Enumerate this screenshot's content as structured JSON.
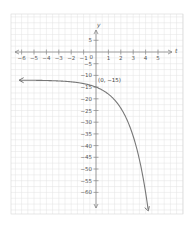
{
  "chart_data": {
    "type": "line",
    "title": "",
    "xlabel": "t",
    "ylabel": "y",
    "xlim": [
      -6.5,
      5.5
    ],
    "ylim": [
      -62,
      8
    ],
    "grid": true,
    "x_ticks": [
      -6,
      -5,
      -4,
      -3,
      -2,
      -1,
      1,
      2,
      3,
      4,
      5
    ],
    "y_ticks": [
      5,
      -5,
      -10,
      -15,
      -20,
      -25,
      -30,
      -35,
      -40,
      -45,
      -50,
      -55,
      -60
    ],
    "origin_label": "0",
    "series": [
      {
        "name": "curve",
        "description": "decreasing exponential, horizontal asymptote near y = -12, arrows on both ends",
        "x": [
          -6,
          -5,
          -4,
          -3,
          -2,
          -1,
          0,
          1,
          2,
          3,
          4,
          4.2
        ],
        "y": [
          -12.05,
          -12.1,
          -12.2,
          -12.4,
          -12.75,
          -13.5,
          -15,
          -18,
          -24,
          -36,
          -60,
          -67
        ]
      }
    ],
    "annotations": [
      {
        "text": "(0, −15)",
        "x": 0,
        "y": -15
      }
    ]
  },
  "colors": {
    "grid": "#e3e3e3",
    "axis": "#888888",
    "curve": "#777777",
    "text": "#555555"
  }
}
